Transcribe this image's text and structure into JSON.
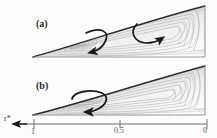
{
  "figure": {
    "type": "streamline-contour-panels",
    "panels": [
      {
        "id": "a",
        "label": "(a)",
        "description": "wedge-shaped meridional domain with closed streamline contours and two curved circulation arrows",
        "arrows": [
          {
            "name": "left-circulation-arrow",
            "direction": "clockwise-down-left"
          },
          {
            "name": "right-circulation-arrow",
            "direction": "clockwise-down-right"
          }
        ]
      },
      {
        "id": "b",
        "label": "(b)",
        "description": "wedge-shaped meridional domain with closed streamline contours and a single looped circulation arrow",
        "arrows": [
          {
            "name": "center-circulation-arrow",
            "direction": "clockwise-loop"
          }
        ]
      }
    ]
  },
  "axis": {
    "title": "r*",
    "direction_arrow": "left",
    "ticks": [
      {
        "value": "1",
        "position_pct": 0
      },
      {
        "value": "0.5",
        "position_pct": 50
      },
      {
        "value": "0",
        "position_pct": 100
      }
    ]
  },
  "colors": {
    "contour_line": "#9a9a9a",
    "boundary_line": "#2b2b2b",
    "arrow": "#1a1a1a",
    "axis": "#6a6a6a",
    "fill_light": "#f4f4f4",
    "fill_shade": "#c9c9c9",
    "text": "#2a2a2a"
  }
}
